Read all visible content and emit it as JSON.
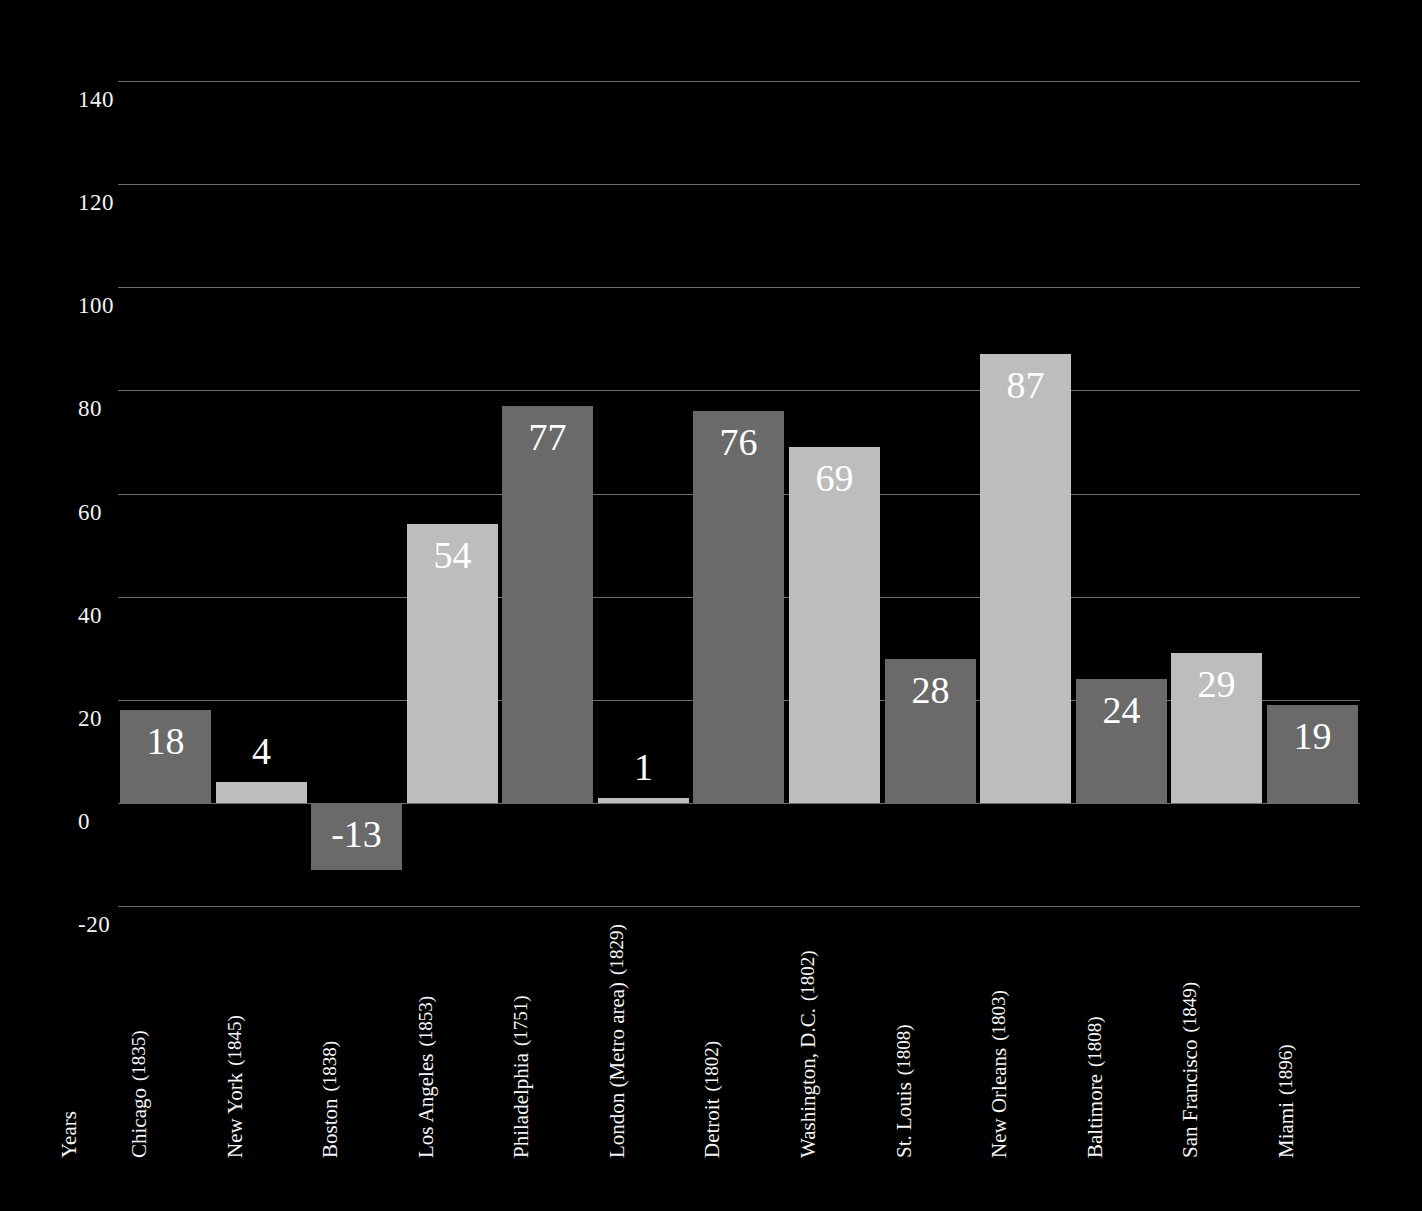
{
  "chart_data": {
    "type": "bar",
    "title": "",
    "xlabel": "Years",
    "ylabel": "",
    "ylim": [
      -20,
      140
    ],
    "ystep": 20,
    "grid": true,
    "legend": "none",
    "ytick_labels": [
      "140",
      "120",
      "100",
      "80",
      "60",
      "40",
      "20",
      "0",
      "-20"
    ],
    "ytick_values": [
      140,
      120,
      100,
      80,
      60,
      40,
      20,
      0,
      -20
    ],
    "categories": [
      "Chicago",
      "New York",
      "Boston",
      "Los Angeles",
      "Philadelphia",
      "London (Metro area)",
      "Detroit",
      "Washington, D.C.",
      "St. Louis",
      "New Orleans",
      "Baltimore",
      "San Francisco",
      "Miami"
    ],
    "category_years": [
      "(1835)",
      "(1845)",
      "(1838)",
      "(1853)",
      "(1751)",
      "(1829)",
      "(1802)",
      "(1802)",
      "(1808)",
      "(1803)",
      "(1808)",
      "(1849)",
      "(1896)"
    ],
    "values": [
      18,
      4,
      -13,
      54,
      77,
      1,
      76,
      69,
      28,
      87,
      24,
      29,
      19
    ],
    "value_labels": [
      "18",
      "4",
      "-13",
      "54",
      "77",
      "1",
      "76",
      "69",
      "28",
      "87",
      "24",
      "29",
      "19"
    ],
    "bar_shades": [
      "dark",
      "light",
      "dark",
      "light",
      "dark",
      "light",
      "dark",
      "light",
      "dark",
      "light",
      "dark",
      "light",
      "dark"
    ]
  },
  "colors": {
    "background": "#000000",
    "bar_dark": "#6a6a6a",
    "bar_light": "#bdbdbd",
    "gridline": "#6d6d6d",
    "text": "#ffffff"
  }
}
